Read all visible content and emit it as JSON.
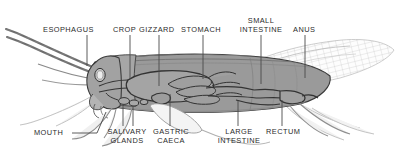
{
  "figure": {
    "background_color": "#ffffff",
    "body_fill_color": "#9a9a9a",
    "outline_color": "#3a3a3a",
    "leader_line_color": "#4a4a4a",
    "text_color": "#2b2b2b"
  },
  "labels": {
    "top": [
      {
        "id": "esophagus",
        "text": "ESOPHAGUS",
        "x": 47,
        "y": 27,
        "leader_x": 87,
        "leader_y1": 35,
        "leader_y2": 66
      },
      {
        "id": "crop",
        "text": "CROP",
        "x": 112,
        "y": 27,
        "leader_x": 130,
        "leader_y1": 35,
        "leader_y2": 79
      },
      {
        "id": "gizzard",
        "text": "GIZZARD",
        "x": 144,
        "y": 27,
        "leader_x": 159,
        "leader_y1": 35,
        "leader_y2": 86
      },
      {
        "id": "stomach",
        "text": "STOMACH",
        "x": 185,
        "y": 27,
        "leader_x": 203,
        "leader_y1": 35,
        "leader_y2": 79
      },
      {
        "id": "small-intestine",
        "text": "SMALL INTESTINE",
        "line1": "SMALL",
        "line2": "INTESTINE",
        "x": 238,
        "y": 18,
        "leader_x": 261,
        "leader_y1": 35,
        "leader_y2": 84
      },
      {
        "id": "anus",
        "text": "ANUS",
        "x": 294,
        "y": 27,
        "leader_x": 305,
        "leader_y1": 35,
        "leader_y2": 78
      }
    ],
    "bottom": [
      {
        "id": "mouth",
        "text": "MOUTH",
        "x": 36,
        "y": 130,
        "leader_type": "diagonal"
      },
      {
        "id": "salivary-glands",
        "text": "SALIVARY GLANDS",
        "line1": "SALIVARY",
        "line2": "GLANDS",
        "x": 104,
        "y": 129,
        "leader_x": 127,
        "leader_y1": 101,
        "leader_y2": 126
      },
      {
        "id": "gastric-caeca",
        "text": "GASTRIC CAECA",
        "line1": "GASTRIC",
        "line2": "CAECA",
        "x": 156,
        "y": 129,
        "leader_x": 170,
        "leader_y1": 94,
        "leader_y2": 126
      },
      {
        "id": "large-intestine",
        "text": "LARGE INTESTINE",
        "line1": "LARGE",
        "line2": "INTESTINE",
        "x": 216,
        "y": 129,
        "leader_x": 238,
        "leader_y1": 96,
        "leader_y2": 126
      },
      {
        "id": "rectum",
        "text": "RECTUM",
        "x": 269,
        "y": 129,
        "leader_x": 282,
        "leader_y1": 96,
        "leader_y2": 126
      }
    ]
  },
  "anatomy_parts": [
    "esophagus",
    "crop",
    "gizzard",
    "stomach",
    "small intestine",
    "anus",
    "mouth",
    "salivary glands",
    "gastric caeca",
    "large intestine",
    "rectum"
  ]
}
